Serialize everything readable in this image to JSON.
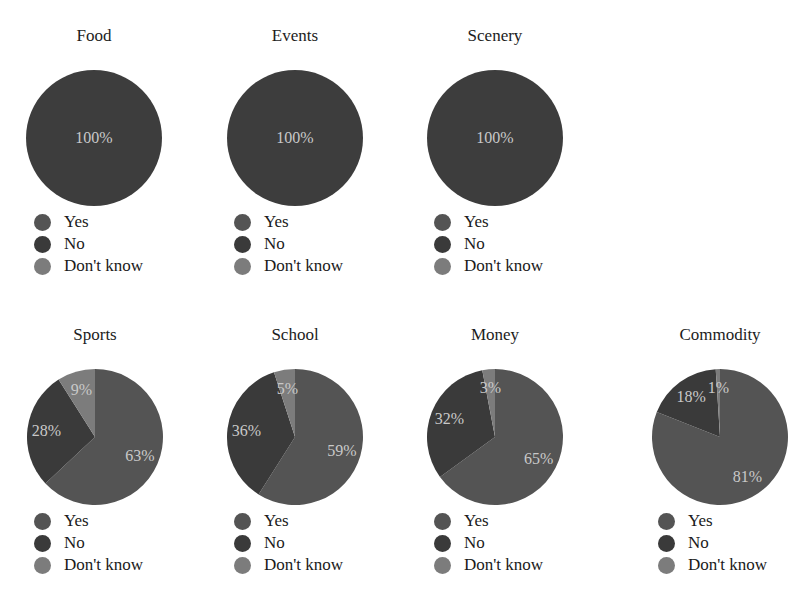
{
  "colors": {
    "yes": "#545454",
    "no": "#3a3a3a",
    "dont_know": "#7c7c7c",
    "full": "#3d3d3d",
    "label": "#cfcfcf"
  },
  "legend": {
    "yes": "Yes",
    "no": "No",
    "dont_know": "Don't know"
  },
  "panels": [
    {
      "title": "Food",
      "x": 0,
      "y": 0,
      "cx": 94,
      "cy": 138,
      "r": 68,
      "legend_x": 34,
      "legend_y": 211
    },
    {
      "title": "Events",
      "x": 200,
      "y": 0,
      "cx": 95,
      "cy": 138,
      "r": 68,
      "legend_x": 34,
      "legend_y": 211
    },
    {
      "title": "Scenery",
      "x": 400,
      "y": 0,
      "cx": 95,
      "cy": 138,
      "r": 68,
      "legend_x": 34,
      "legend_y": 211
    },
    {
      "title": "Sports",
      "x": 0,
      "y": 299,
      "cx": 95,
      "cy": 138,
      "r": 68,
      "legend_x": 34,
      "legend_y": 211
    },
    {
      "title": "School",
      "x": 200,
      "y": 299,
      "cx": 95,
      "cy": 138,
      "r": 68,
      "legend_x": 34,
      "legend_y": 211
    },
    {
      "title": "Money",
      "x": 400,
      "y": 299,
      "cx": 95,
      "cy": 138,
      "r": 68,
      "legend_x": 34,
      "legend_y": 211
    },
    {
      "title": "Commodity",
      "x": 610,
      "y": 299,
      "cx": 110,
      "cy": 138,
      "r": 68,
      "legend_x": 48,
      "legend_y": 211
    }
  ],
  "chart_data": [
    {
      "type": "pie",
      "title": "Food",
      "labels": [
        "Yes",
        "No",
        "Don't know"
      ],
      "values": [
        100,
        0,
        0
      ],
      "data_labels": [
        "100%"
      ]
    },
    {
      "type": "pie",
      "title": "Events",
      "labels": [
        "Yes",
        "No",
        "Don't know"
      ],
      "values": [
        100,
        0,
        0
      ],
      "data_labels": [
        "100%"
      ]
    },
    {
      "type": "pie",
      "title": "Scenery",
      "labels": [
        "Yes",
        "No",
        "Don't know"
      ],
      "values": [
        100,
        0,
        0
      ],
      "data_labels": [
        "100%"
      ]
    },
    {
      "type": "pie",
      "title": "Sports",
      "labels": [
        "Yes",
        "No",
        "Don't know"
      ],
      "values": [
        63,
        28,
        9
      ],
      "data_labels": [
        "63%",
        "28%",
        "9%"
      ]
    },
    {
      "type": "pie",
      "title": "School",
      "labels": [
        "Yes",
        "No",
        "Don't know"
      ],
      "values": [
        59,
        36,
        5
      ],
      "data_labels": [
        "59%",
        "36%",
        "5%"
      ]
    },
    {
      "type": "pie",
      "title": "Money",
      "labels": [
        "Yes",
        "No",
        "Don't know"
      ],
      "values": [
        65,
        32,
        3
      ],
      "data_labels": [
        "65%",
        "32%",
        "3%"
      ]
    },
    {
      "type": "pie",
      "title": "Commodity",
      "labels": [
        "Yes",
        "No",
        "Don't know"
      ],
      "values": [
        81,
        18,
        1
      ],
      "data_labels": [
        "81%",
        "18%",
        "1%"
      ]
    }
  ]
}
